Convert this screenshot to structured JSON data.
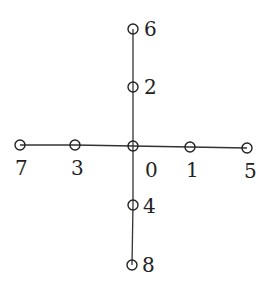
{
  "diagram": {
    "type": "tree",
    "nodes": [
      {
        "id": "0",
        "label": "0",
        "x": 133,
        "y": 146,
        "lx": 145,
        "ly": 177
      },
      {
        "id": "1",
        "label": "1",
        "x": 190,
        "y": 147,
        "lx": 186,
        "ly": 177
      },
      {
        "id": "2",
        "label": "2",
        "x": 133,
        "y": 87,
        "lx": 144,
        "ly": 94
      },
      {
        "id": "3",
        "label": "3",
        "x": 75,
        "y": 145,
        "lx": 71,
        "ly": 175
      },
      {
        "id": "4",
        "label": "4",
        "x": 133,
        "y": 205,
        "lx": 143,
        "ly": 213
      },
      {
        "id": "5",
        "label": "5",
        "x": 247,
        "y": 148,
        "lx": 244,
        "ly": 178
      },
      {
        "id": "6",
        "label": "6",
        "x": 133,
        "y": 29,
        "lx": 144,
        "ly": 36
      },
      {
        "id": "7",
        "label": "7",
        "x": 20,
        "y": 145,
        "lx": 15,
        "ly": 175
      },
      {
        "id": "8",
        "label": "8",
        "x": 132,
        "y": 265,
        "lx": 142,
        "ly": 272
      }
    ],
    "edges": [
      [
        "7",
        "3"
      ],
      [
        "3",
        "0"
      ],
      [
        "0",
        "1"
      ],
      [
        "1",
        "5"
      ],
      [
        "6",
        "2"
      ],
      [
        "2",
        "0"
      ],
      [
        "0",
        "4"
      ],
      [
        "4",
        "8"
      ]
    ],
    "node_radius": 5
  }
}
